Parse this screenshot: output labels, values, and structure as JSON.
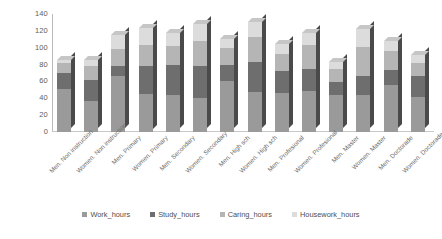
{
  "chart_data": {
    "type": "bar",
    "subtype": "stacked-3d-column",
    "title": "",
    "xlabel": "",
    "ylabel": "",
    "ylim": [
      0,
      140
    ],
    "yticks": [
      0,
      20,
      40,
      60,
      80,
      100,
      120,
      140
    ],
    "grid": false,
    "legend_position": "bottom",
    "categories": [
      "Men. Non instruction",
      "Women. Non instruction",
      "Men. Primary",
      "Women. Primary",
      "Men. Secondary",
      "Women. Secondary",
      "Men. High sch",
      "Women. High sch",
      "Men. Profesional",
      "Women. Profesional",
      "Men. Master",
      "Women. Master",
      "Men. Doctorade",
      "Women. Doctorade"
    ],
    "series": [
      {
        "name": "Work_hours",
        "color": "#9a9a9a",
        "values": [
          51,
          37,
          66,
          45,
          44,
          40,
          61,
          47,
          46,
          49,
          44,
          44,
          56,
          42
        ]
      },
      {
        "name": "Study_hours",
        "color": "#6e6e6e",
        "values": [
          19,
          25,
          12,
          33,
          36,
          38,
          19,
          36,
          26,
          26,
          15,
          22,
          18,
          24
        ]
      },
      {
        "name": "Caring_hours",
        "color": "#b5b5b5",
        "values": [
          12,
          16,
          20,
          25,
          22,
          30,
          20,
          30,
          20,
          28,
          16,
          35,
          22,
          16
        ]
      },
      {
        "name": "Housework_hours",
        "color": "#dcdcdc",
        "values": [
          4,
          8,
          17,
          21,
          15,
          20,
          10,
          17,
          12,
          15,
          8,
          21,
          12,
          9
        ]
      }
    ],
    "totals": [
      86,
      86,
      115,
      124,
      117,
      128,
      110,
      130,
      104,
      118,
      83,
      122,
      108,
      91
    ]
  },
  "legend": {
    "items": [
      {
        "label": "Work_hours",
        "color": "#9a9a9a"
      },
      {
        "label": "Study_hours",
        "color": "#6e6e6e"
      },
      {
        "label": "Caring_hours",
        "color": "#b5b5b5"
      },
      {
        "label": "Housework_hours",
        "color": "#dcdcdc"
      }
    ]
  },
  "axis": {
    "y_tick_labels": [
      "140",
      "120",
      "100",
      "80",
      "60",
      "40",
      "20",
      "0"
    ]
  }
}
